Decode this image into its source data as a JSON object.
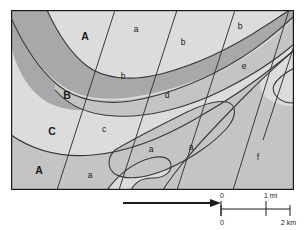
{
  "figure": {
    "kind": "geologic-facies-map",
    "width": 305,
    "height": 230,
    "background": "#ffffff"
  },
  "map": {
    "frame": {
      "border_color": "#1a1a1a",
      "border_width": 1
    },
    "fills": {
      "light": "#dcdcdc",
      "medium": "#c4c4c4",
      "dark": "#a8a8a8",
      "line": "#3a3a3a"
    },
    "unit_labels": [
      {
        "text": "A",
        "x": 74,
        "y": 27
      },
      {
        "text": "B",
        "x": 56,
        "y": 86
      },
      {
        "text": "C",
        "x": 41,
        "y": 122
      },
      {
        "text": "A",
        "x": 28,
        "y": 161
      }
    ],
    "facies_labels": [
      {
        "text": "a",
        "x": 125,
        "y": 20
      },
      {
        "text": "b",
        "x": 229,
        "y": 17
      },
      {
        "text": "b",
        "x": 172,
        "y": 33
      },
      {
        "text": "b",
        "x": 112,
        "y": 67
      },
      {
        "text": "e",
        "x": 233,
        "y": 57
      },
      {
        "text": "d",
        "x": 156,
        "y": 86
      },
      {
        "text": "c",
        "x": 93,
        "y": 120
      },
      {
        "text": "a",
        "x": 140,
        "y": 140
      },
      {
        "text": "a",
        "x": 180,
        "y": 138
      },
      {
        "text": "f",
        "x": 247,
        "y": 148
      },
      {
        "text": "a",
        "x": 79,
        "y": 166
      }
    ]
  },
  "annotations": {
    "direction_arrow": {
      "name": "direction-arrow",
      "points": "right",
      "color": "#1a1a1a"
    },
    "scale_bar": {
      "color": "#1a1a1a",
      "miles": {
        "start_label": "0",
        "end_label": "1 mi"
      },
      "kilometers": {
        "start_label": "0",
        "end_label": "2 km"
      }
    }
  }
}
